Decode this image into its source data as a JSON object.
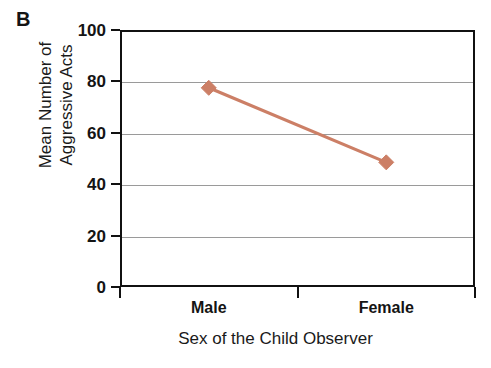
{
  "panel": {
    "letter": "B"
  },
  "chart_data": {
    "type": "line",
    "title": "",
    "subtitle": "",
    "xlabel": "Sex of the Child Observer",
    "ylabel": "Mean Number of Aggressive Acts",
    "ylabel_line1": "Mean Number of",
    "ylabel_line2": "Aggressive Acts",
    "categories": [
      "Male",
      "Female"
    ],
    "values": [
      77.5,
      48.5
    ],
    "series": [
      {
        "name": "Mean Number of Aggressive Acts",
        "values": [
          77.5,
          48.5
        ],
        "color": "#cc7f66",
        "marker": "diamond"
      }
    ],
    "ylim": [
      0,
      100
    ],
    "yticks": [
      0,
      20,
      40,
      60,
      80,
      100
    ],
    "ytick_labels": [
      "0",
      "20",
      "40",
      "60",
      "80",
      "100"
    ],
    "xtick_labels": [
      "Male",
      "Female"
    ],
    "grid": true,
    "grid_axis": "y",
    "grid_color": "#9a9a9a",
    "legend": false,
    "legend_position": "none",
    "axis_color": "#111111",
    "background": "#ffffff"
  }
}
